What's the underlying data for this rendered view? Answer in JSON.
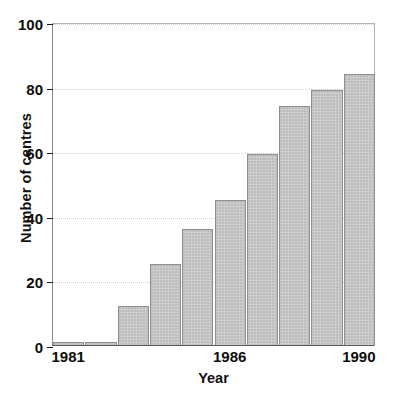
{
  "chart_data": {
    "type": "bar",
    "title": "",
    "xlabel": "Year",
    "ylabel": "Number of centres",
    "categories": [
      "1981",
      "1982",
      "1983",
      "1984",
      "1985",
      "1986",
      "1987",
      "1988",
      "1989",
      "1990"
    ],
    "values": [
      1,
      1,
      12,
      25,
      36,
      45,
      59,
      74,
      79,
      84
    ],
    "ylim": [
      0,
      100
    ],
    "yticks": [
      0,
      20,
      40,
      60,
      80,
      100
    ],
    "ytick_labels": [
      "0",
      "20",
      "40",
      "60",
      "80",
      "100"
    ],
    "xtick_labels": [
      "1981",
      "1986",
      "1990"
    ],
    "xtick_categories": [
      "1981",
      "1986",
      "1990"
    ],
    "grid": "horizontal-dotted",
    "legend": "none",
    "bar_fill": "#c9c9c9",
    "bar_border": "#8e8e8e",
    "grid_color": "#cfcfcf",
    "axis_color": "#1a1a1a",
    "background": "#ffffff"
  },
  "figure": {
    "ylabel": "Number of centres",
    "xlabel": "Year"
  },
  "caption": {
    "sliver_text": ""
  }
}
